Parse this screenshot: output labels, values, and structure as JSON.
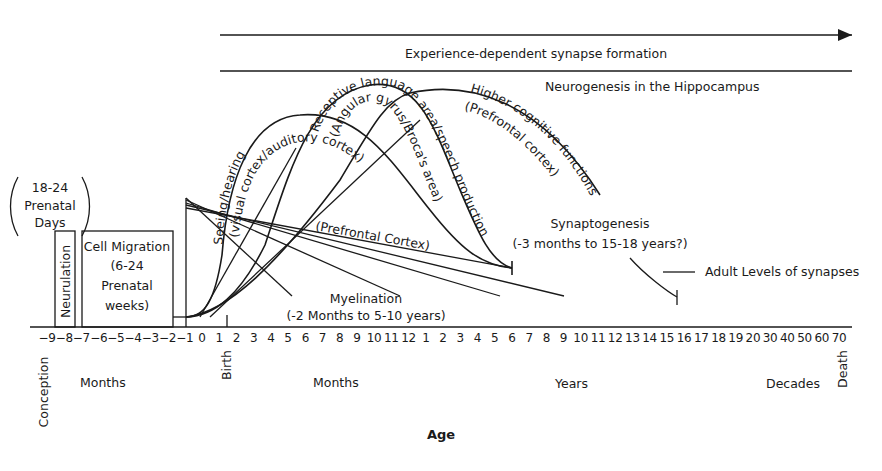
{
  "diagram": {
    "top_bands": {
      "experience_label": "Experience-dependent synapse formation",
      "neurogenesis_label": "Neurogenesis in the Hippocampus"
    },
    "prenatal": {
      "neurulation_days": [
        "18-24",
        "Prenatal",
        "Days"
      ],
      "neurulation_label": "Neurulation",
      "cell_migration": [
        "Cell Migration",
        "(6-24",
        "Prenatal",
        "weeks)"
      ]
    },
    "curves": {
      "seeing_hearing": "Seeing/hearing",
      "visual_auditory": "(visual cortex/auditory cortex)",
      "receptive_language": "Receptive language area/speech production",
      "angular_gyrus": "(Angular gyrus/Broca's area)",
      "higher_cognitive": "Higher cognitive functions",
      "prefrontal_cortex_lower": "(Prefrontal cortex)"
    },
    "myelination": {
      "prefrontal_label": "(Prefrontal Cortex)",
      "label": "Myelination",
      "range": "(-2 Months to 5-10 years)"
    },
    "synaptogenesis": {
      "label": "Synaptogenesis",
      "range": "(-3 months to 15-18 years?)"
    },
    "adult_levels": "Adult Levels of synapses",
    "axis": {
      "ticks": [
        "-9",
        "-8",
        "-7",
        "-6",
        "-5",
        "-4",
        "-3",
        "-2",
        "-1",
        "0",
        "1",
        "2",
        "3",
        "4",
        "5",
        "6",
        "7",
        "8",
        "9",
        "10",
        "11",
        "12",
        "1",
        "2",
        "3",
        "4",
        "5",
        "6",
        "7",
        "8",
        "9",
        "10",
        "11",
        "12",
        "13",
        "14",
        "15",
        "16",
        "17",
        "18",
        "19",
        "20",
        "30",
        "40",
        "50",
        "60",
        "70"
      ],
      "markers": {
        "conception": "Conception",
        "birth": "Birth",
        "death": "Death"
      },
      "units": {
        "prenatal_months": "Months",
        "postnatal_months": "Months",
        "years": "Years",
        "decades": "Decades"
      },
      "xlabel": "Age"
    }
  }
}
